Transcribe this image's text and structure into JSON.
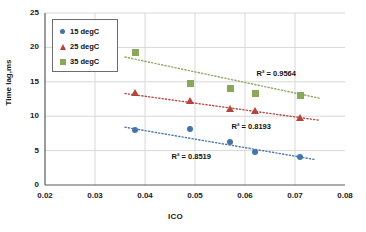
{
  "chart_data": {
    "type": "scatter",
    "title": "",
    "xlabel": "ICO",
    "ylabel": "Time lag,ms",
    "xlim": [
      0.02,
      0.08
    ],
    "ylim": [
      0,
      25
    ],
    "xticks": [
      "0.02",
      "0.03",
      "0.04",
      "0.05",
      "0.06",
      "0.07",
      "0.08"
    ],
    "yticks": [
      "0",
      "5",
      "10",
      "15",
      "20",
      "25"
    ],
    "grid": true,
    "legend_position": "top-left",
    "series": [
      {
        "name": "15 degC",
        "color": "#4574ab",
        "marker": "circle",
        "x": [
          0.038,
          0.049,
          0.057,
          0.062,
          0.071
        ],
        "y": [
          8.0,
          8.2,
          6.2,
          4.8,
          4.0
        ],
        "trendline": {
          "x0": 0.036,
          "y0": 8.4,
          "x1": 0.074,
          "y1": 3.7
        },
        "r2_label": "R² = 0.8519",
        "r2_value": 0.8519
      },
      {
        "name": "25 degC",
        "color": "#b5453c",
        "marker": "triangle",
        "x": [
          0.038,
          0.049,
          0.057,
          0.062,
          0.071
        ],
        "y": [
          13.3,
          12.2,
          11.0,
          10.7,
          9.7
        ],
        "trendline": {
          "x0": 0.036,
          "y0": 13.3,
          "x1": 0.075,
          "y1": 9.4
        },
        "r2_label": "R² = 0.8193",
        "r2_value": 0.8193
      },
      {
        "name": "35 degC",
        "color": "#8aa75b",
        "marker": "square",
        "x": [
          0.038,
          0.049,
          0.057,
          0.062,
          0.071
        ],
        "y": [
          19.3,
          14.7,
          14.0,
          13.3,
          13.0
        ],
        "trendline": {
          "x0": 0.036,
          "y0": 18.6,
          "x1": 0.075,
          "y1": 12.6
        },
        "r2_label": "R² = 0.9564",
        "r2_value": 0.9564
      }
    ],
    "annotations": [
      {
        "text": "R² = 0.9564",
        "x": 0.0675,
        "y": 16.2
      },
      {
        "text": "R² = 0.8193",
        "x": 0.0625,
        "y": 8.5
      },
      {
        "text": "R² = 0.8519",
        "x": 0.0505,
        "y": 4.0
      }
    ]
  },
  "legend": {
    "items": [
      {
        "label": "15 degC"
      },
      {
        "label": "25 degC"
      },
      {
        "label": "35 degC"
      }
    ]
  }
}
